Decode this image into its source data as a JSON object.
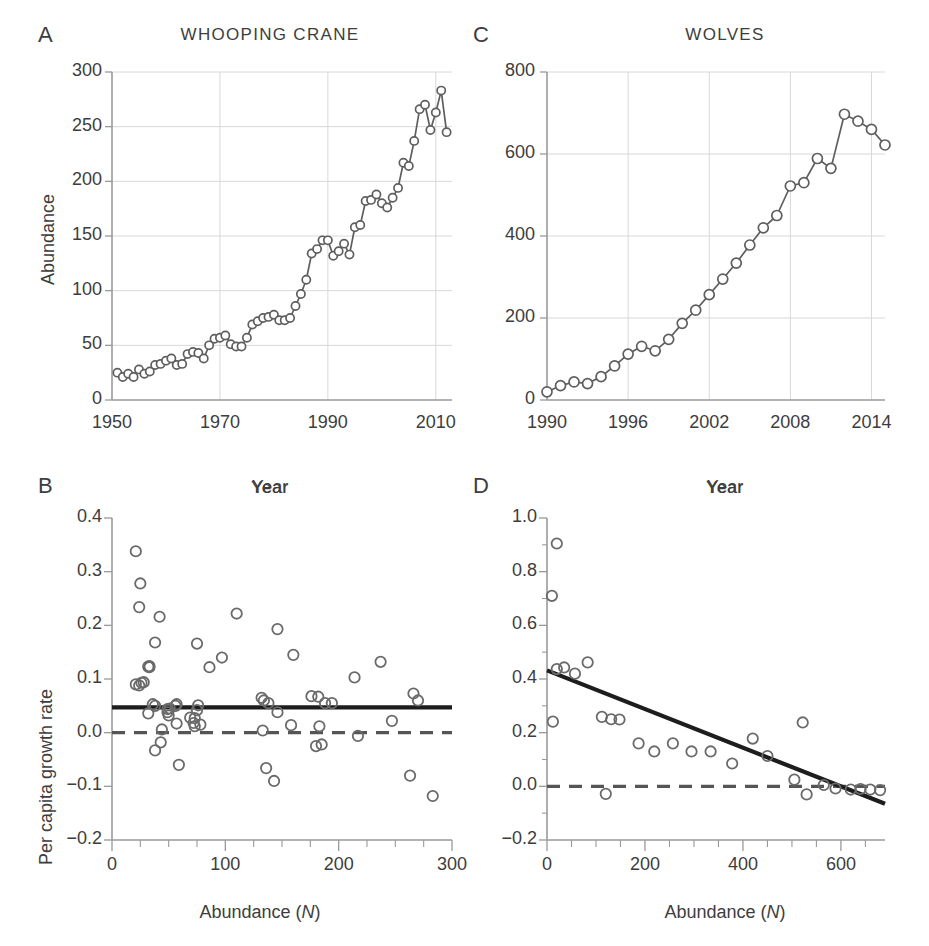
{
  "figure": {
    "panels": [
      "A",
      "B",
      "C",
      "D"
    ]
  },
  "panel_a": {
    "letter": "A",
    "title": "WHOOPING CRANE",
    "xlabel": "Year",
    "ylabel": "Abundance"
  },
  "panel_b": {
    "letter": "B",
    "title": "Year",
    "xlabel_pre": "Abundance (",
    "xlabel_italic": "N",
    "xlabel_post": ")",
    "ylabel": "Per capita growth rate"
  },
  "panel_c": {
    "letter": "C",
    "title": "WOLVES",
    "xlabel": "Year"
  },
  "panel_d": {
    "letter": "D",
    "title": "Year",
    "xlabel_pre": "Abundance (",
    "xlabel_italic": "N",
    "xlabel_post": ")"
  },
  "chart_data": [
    {
      "id": "A",
      "type": "line",
      "title": "WHOOPING CRANE",
      "xlabel": "Year",
      "ylabel": "Abundance",
      "xlim": [
        1950,
        2013
      ],
      "ylim": [
        0,
        300
      ],
      "xticks": [
        1950,
        1970,
        1990,
        2010
      ],
      "yticks": [
        0,
        50,
        100,
        150,
        200,
        250,
        300
      ],
      "grid": true,
      "markers": "open-circle",
      "x": [
        1951,
        1952,
        1953,
        1954,
        1955,
        1956,
        1957,
        1958,
        1959,
        1960,
        1961,
        1962,
        1963,
        1964,
        1965,
        1966,
        1967,
        1968,
        1969,
        1970,
        1971,
        1972,
        1973,
        1974,
        1975,
        1976,
        1977,
        1978,
        1979,
        1980,
        1981,
        1982,
        1983,
        1984,
        1985,
        1986,
        1987,
        1988,
        1989,
        1990,
        1991,
        1992,
        1993,
        1994,
        1995,
        1996,
        1997,
        1998,
        1999,
        2000,
        1901,
        2002,
        2003,
        2004,
        2005,
        2006,
        2007,
        2008,
        2009,
        2010,
        2011,
        2012
      ],
      "values": [
        25,
        21,
        24,
        21,
        28,
        24,
        26,
        32,
        33,
        36,
        38,
        32,
        33,
        42,
        44,
        43,
        38,
        50,
        56,
        57,
        59,
        51,
        49,
        49,
        57,
        69,
        72,
        75,
        76,
        78,
        73,
        73,
        75,
        86,
        97,
        110,
        134,
        138,
        146,
        146,
        132,
        136,
        143,
        133,
        158,
        160,
        182,
        183,
        188,
        180,
        176,
        185,
        194,
        217,
        214,
        237,
        266,
        270,
        247,
        263,
        283,
        245
      ]
    },
    {
      "id": "B",
      "type": "scatter",
      "title": "Year",
      "xlabel": "Abundance (N)",
      "ylabel": "Per capita growth rate",
      "xlim": [
        0,
        300
      ],
      "ylim": [
        -0.2,
        0.4
      ],
      "xticks": [
        0,
        100,
        200,
        300
      ],
      "xminor_step": 25,
      "yticks": [
        -0.2,
        -0.1,
        0.0,
        0.1,
        0.2,
        0.3,
        0.4
      ],
      "grid": false,
      "markers": "open-circle",
      "regression": {
        "intercept": 0.047,
        "slope": 0.0,
        "style": "solid",
        "label": "mean growth rate"
      },
      "reference": {
        "y": 0.0,
        "style": "dashed",
        "label": "zero growth"
      },
      "points": [
        [
          21,
          0.338
        ],
        [
          25,
          0.278
        ],
        [
          24,
          0.234
        ],
        [
          21,
          0.09
        ],
        [
          24,
          0.088
        ],
        [
          28,
          0.094
        ],
        [
          26,
          0.093
        ],
        [
          32,
          0.036
        ],
        [
          33,
          0.122
        ],
        [
          33,
          0.124
        ],
        [
          36,
          0.053
        ],
        [
          38,
          0.168
        ],
        [
          38,
          0.05
        ],
        [
          32,
          0.123
        ],
        [
          42,
          0.216
        ],
        [
          44,
          0.006
        ],
        [
          43,
          -0.018
        ],
        [
          38,
          -0.033
        ],
        [
          50,
          0.032
        ],
        [
          56,
          0.05
        ],
        [
          57,
          0.017
        ],
        [
          59,
          -0.06
        ],
        [
          51,
          0.045
        ],
        [
          49,
          0.044
        ],
        [
          49,
          0.038
        ],
        [
          57,
          0.053
        ],
        [
          69,
          0.028
        ],
        [
          72,
          0.018
        ],
        [
          75,
          0.042
        ],
        [
          76,
          0.051
        ],
        [
          78,
          0.015
        ],
        [
          73,
          0.012
        ],
        [
          73,
          0.027
        ],
        [
          75,
          0.166
        ],
        [
          86,
          0.122
        ],
        [
          97,
          0.14
        ],
        [
          110,
          0.222
        ],
        [
          134,
          0.06
        ],
        [
          138,
          0.055
        ],
        [
          146,
          0.038
        ],
        [
          146,
          0.193
        ],
        [
          132,
          0.065
        ],
        [
          136,
          -0.066
        ],
        [
          143,
          -0.09
        ],
        [
          133,
          0.004
        ],
        [
          158,
          0.014
        ],
        [
          160,
          0.145
        ],
        [
          182,
          0.067
        ],
        [
          183,
          0.012
        ],
        [
          188,
          0.055
        ],
        [
          180,
          -0.025
        ],
        [
          176,
          0.068
        ],
        [
          185,
          -0.022
        ],
        [
          194,
          0.055
        ],
        [
          217,
          -0.006
        ],
        [
          214,
          0.103
        ],
        [
          237,
          0.132
        ],
        [
          266,
          0.073
        ],
        [
          270,
          0.06
        ],
        [
          247,
          0.022
        ],
        [
          263,
          -0.08
        ],
        [
          283,
          -0.118
        ]
      ]
    },
    {
      "id": "C",
      "type": "line",
      "title": "WOLVES",
      "xlabel": "Year",
      "ylabel": "",
      "xlim": [
        1990,
        2015
      ],
      "ylim": [
        0,
        800
      ],
      "xticks": [
        1990,
        1996,
        2002,
        2008,
        2014
      ],
      "yticks": [
        0,
        200,
        400,
        600,
        800
      ],
      "grid": true,
      "markers": "open-circle",
      "x": [
        1990,
        1991,
        1992,
        1993,
        1994,
        1995,
        1996,
        1997,
        1998,
        1999,
        2000,
        2001,
        2002,
        2003,
        2004,
        2005,
        2006,
        2007,
        2008,
        2009,
        2010,
        2011,
        2012,
        2013,
        2014,
        2015
      ],
      "values": [
        20,
        35,
        44,
        40,
        57,
        83,
        112,
        131,
        120,
        148,
        187,
        219,
        257,
        295,
        334,
        378,
        420,
        450,
        522,
        530,
        589,
        565,
        697,
        680,
        660,
        622
      ]
    },
    {
      "id": "D",
      "type": "scatter",
      "title": "Year",
      "xlabel": "Abundance (N)",
      "ylabel": "",
      "xlim": [
        0,
        690
      ],
      "ylim": [
        -0.2,
        1.0
      ],
      "xticks": [
        0,
        200,
        400,
        600
      ],
      "xminor_step": 50,
      "yticks": [
        -0.2,
        0.0,
        0.2,
        0.4,
        0.6,
        0.8,
        1.0
      ],
      "yminor_step": 0.1,
      "grid": false,
      "markers": "open-circle",
      "regression": {
        "intercept": 0.432,
        "slope": -0.00072,
        "style": "solid",
        "label": "density dependence"
      },
      "reference": {
        "y": 0.0,
        "style": "dashed",
        "label": "zero growth"
      },
      "points": [
        [
          20,
          0.905
        ],
        [
          10,
          0.71
        ],
        [
          35,
          0.443
        ],
        [
          20,
          0.437
        ],
        [
          57,
          0.42
        ],
        [
          83,
          0.462
        ],
        [
          12,
          0.241
        ],
        [
          112,
          0.259
        ],
        [
          131,
          0.25
        ],
        [
          120,
          -0.028
        ],
        [
          148,
          0.249
        ],
        [
          187,
          0.16
        ],
        [
          219,
          0.13
        ],
        [
          257,
          0.16
        ],
        [
          295,
          0.13
        ],
        [
          334,
          0.13
        ],
        [
          378,
          0.085
        ],
        [
          420,
          0.178
        ],
        [
          450,
          0.113
        ],
        [
          505,
          0.025
        ],
        [
          522,
          0.238
        ],
        [
          530,
          -0.03
        ],
        [
          565,
          0.005
        ],
        [
          589,
          -0.008
        ],
        [
          620,
          -0.012
        ],
        [
          640,
          -0.01
        ],
        [
          660,
          -0.012
        ],
        [
          680,
          -0.014
        ]
      ]
    }
  ]
}
